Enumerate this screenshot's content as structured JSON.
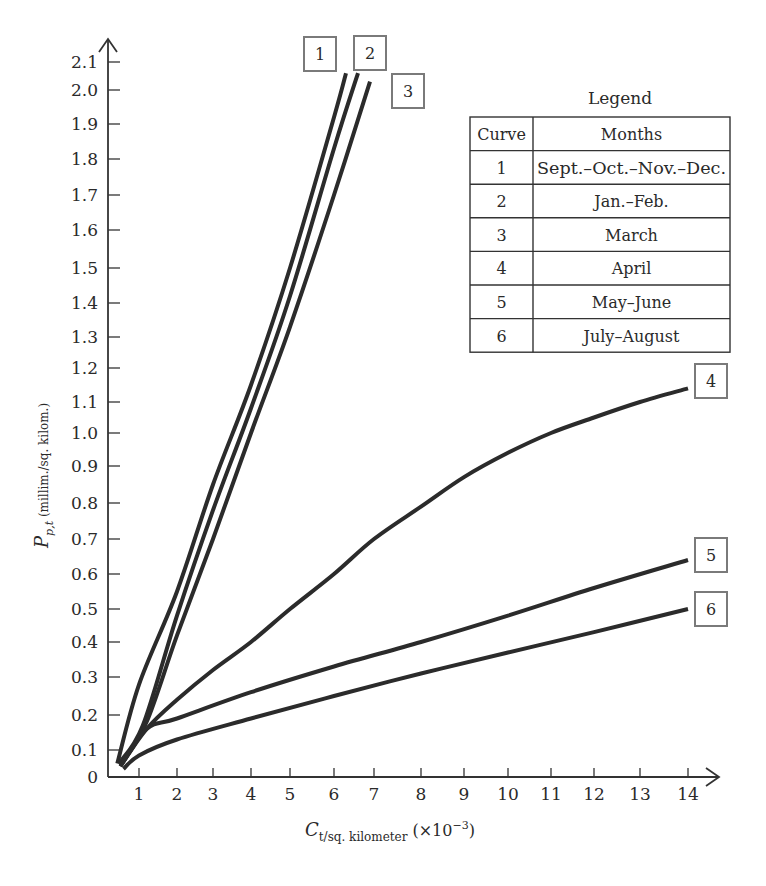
{
  "chart_data": {
    "type": "line",
    "title": "",
    "xlabel": "C_{t/sq. kilometer} (×10^-3)",
    "xlabel_parts": {
      "main": "C",
      "sub": "t/sq. kilometer",
      "suffix": "(×10",
      "exp": "−3",
      "close": ")"
    },
    "ylabel": "P_{p,t} (millim./sq. kilom.)",
    "ylabel_parts": {
      "main": "P",
      "sub": "p,t",
      "suffix": " (millim./sq. kilom.)"
    },
    "xlim": [
      0,
      14.7
    ],
    "ylim": [
      0,
      2.15
    ],
    "grid": false,
    "x_ticks": [
      1,
      2,
      3,
      4,
      5,
      6,
      7,
      8,
      9,
      10,
      11,
      12,
      13,
      14
    ],
    "x_tick_labels": [
      "1",
      "2",
      "3",
      "4",
      "5",
      "6",
      "7",
      "8",
      "9",
      "10",
      "11",
      "12",
      "13",
      "14"
    ],
    "y_ticks": [
      0,
      0.1,
      0.2,
      0.3,
      0.4,
      0.5,
      0.6,
      0.7,
      0.8,
      0.9,
      1.0,
      1.1,
      1.2,
      1.3,
      1.4,
      1.5,
      1.6,
      1.7,
      1.8,
      1.9,
      2.0,
      2.1
    ],
    "y_tick_labels": [
      "0",
      "0.1",
      "0.2",
      "0.3",
      "0.4",
      "0.5",
      "0.6",
      "0.7",
      "0.8",
      "0.9",
      "1.0",
      "1.1",
      "1.2",
      "1.3",
      "1.4",
      "1.5",
      "1.6",
      "1.7",
      "1.8",
      "1.9",
      "2.0",
      "2.1"
    ],
    "legend": {
      "title": "Legend",
      "position": "upper right",
      "headers": [
        "Curve",
        "Months"
      ],
      "rows": [
        [
          "1",
          "Sept.–Oct.–Nov.–Dec."
        ],
        [
          "2",
          "Jan.–Feb."
        ],
        [
          "3",
          "March"
        ],
        [
          "4",
          "April"
        ],
        [
          "5",
          "May–June"
        ],
        [
          "6",
          "July–August"
        ]
      ]
    },
    "series": [
      {
        "name": "1",
        "label": "Sept.–Oct.–Nov.–Dec.",
        "x": [
          0.3,
          1.0,
          2.0,
          3.0,
          4.0,
          5.0,
          6.0,
          6.3
        ],
        "y": [
          0.05,
          0.28,
          0.55,
          0.85,
          1.15,
          1.5,
          1.92,
          2.06
        ]
      },
      {
        "name": "2",
        "label": "Jan.–Feb.",
        "x": [
          0.35,
          1.1,
          2.0,
          3.0,
          4.0,
          5.0,
          6.0,
          6.6
        ],
        "y": [
          0.05,
          0.17,
          0.48,
          0.78,
          1.08,
          1.42,
          1.83,
          2.06
        ]
      },
      {
        "name": "3",
        "label": "March",
        "x": [
          0.4,
          1.2,
          2.0,
          3.0,
          4.0,
          5.0,
          6.0,
          6.9
        ],
        "y": [
          0.04,
          0.18,
          0.42,
          0.7,
          1.0,
          1.33,
          1.7,
          2.03
        ]
      },
      {
        "name": "4",
        "label": "April",
        "x": [
          0.4,
          1.2,
          2.0,
          3.0,
          4.0,
          5.0,
          6.0,
          7.0,
          8.0,
          9.0,
          10.0,
          11.0,
          12.0,
          13.0,
          14.0
        ],
        "y": [
          0.04,
          0.16,
          0.24,
          0.32,
          0.4,
          0.5,
          0.6,
          0.7,
          0.79,
          0.87,
          0.94,
          1.0,
          1.05,
          1.1,
          1.14
        ]
      },
      {
        "name": "5",
        "label": "May–June",
        "x": [
          0.4,
          1.2,
          2.0,
          4.0,
          6.0,
          8.0,
          10.0,
          12.0,
          14.0
        ],
        "y": [
          0.04,
          0.16,
          0.19,
          0.26,
          0.33,
          0.4,
          0.48,
          0.56,
          0.64
        ]
      },
      {
        "name": "6",
        "label": "July–August",
        "x": [
          0.5,
          1.0,
          2.0,
          4.0,
          6.0,
          8.0,
          10.0,
          12.0,
          14.0
        ],
        "y": [
          0.03,
          0.08,
          0.13,
          0.19,
          0.25,
          0.31,
          0.37,
          0.43,
          0.5
        ]
      }
    ],
    "annotations": [
      {
        "text": "1",
        "series": "1",
        "at": "top end"
      },
      {
        "text": "2",
        "series": "2",
        "at": "top end"
      },
      {
        "text": "3",
        "series": "3",
        "at": "top end"
      },
      {
        "text": "4",
        "series": "4",
        "at": "right end"
      },
      {
        "text": "5",
        "series": "5",
        "at": "right end"
      },
      {
        "text": "6",
        "series": "6",
        "at": "right end"
      }
    ]
  },
  "style": {
    "line_color": "#2b2b2b",
    "axis_color": "#333333",
    "box_color": "#7a7a7a",
    "background": "#ffffff"
  }
}
